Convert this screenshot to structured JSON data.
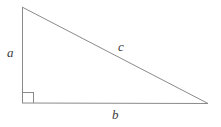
{
  "figure": {
    "name": "right-triangle",
    "background_color": "#ffffff",
    "stroke_color": "#8a8a8a",
    "label_color": "#3b3b3b",
    "stroke_width": 1,
    "width": 221,
    "height": 127
  },
  "labels": {
    "leg_vertical": "a",
    "hypotenuse": "c",
    "leg_horizontal": "b"
  },
  "geometry": {
    "apex": {
      "x": 22,
      "y": 7
    },
    "right_angle_vertex": {
      "x": 22,
      "y": 103
    },
    "right_vertex": {
      "x": 208,
      "y": 104
    },
    "right_angle_marker_size": 11
  }
}
